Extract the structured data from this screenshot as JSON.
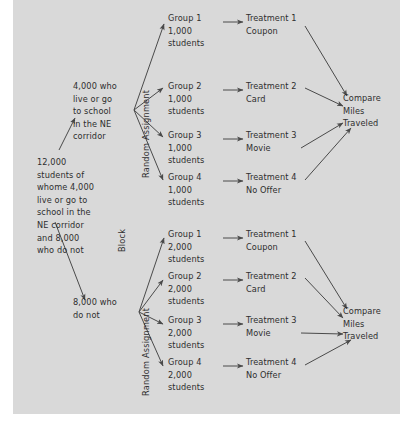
{
  "diagram": {
    "panel_color": "#d9d9d9",
    "ink_color": "#2e2e2e",
    "root": {
      "label": "12,000\nstudents of\nwhome 4,000\nlive or go to\nschool in the\nNE corridor\nand 8,000\nwho do not"
    },
    "blocks": [
      {
        "label": "4,000 who\nlive or go\nto school\nin the NE\ncorridor"
      },
      {
        "label": "8,000 who\ndo not"
      }
    ],
    "stage_labels": {
      "block": "Block",
      "random_assignment_top": "Random Assignment",
      "random_assignment_bottom": "Random Assignment"
    },
    "top_branch": {
      "groups": [
        {
          "label": "Group 1\n1,000\nstudents"
        },
        {
          "label": "Group 2\n1,000\nstudents"
        },
        {
          "label": "Group 3\n1,000\nstudents"
        },
        {
          "label": "Group 4\n1,000\nstudents"
        }
      ],
      "treatments": [
        {
          "label": "Treatment 1\nCoupon"
        },
        {
          "label": "Treatment 2\nCard"
        },
        {
          "label": "Treatment 3\nMovie"
        },
        {
          "label": "Treatment 4\nNo Offer"
        }
      ],
      "outcome": {
        "label": "Compare\nMiles\nTraveled"
      }
    },
    "bottom_branch": {
      "groups": [
        {
          "label": "Group 1\n2,000\nstudents"
        },
        {
          "label": "Group 2\n2,000\nstudents"
        },
        {
          "label": "Group 3\n2,000\nstudents"
        },
        {
          "label": "Group 4\n2,000\nstudents"
        }
      ],
      "treatments": [
        {
          "label": "Treatment 1\nCoupon"
        },
        {
          "label": "Treatment 2\nCard"
        },
        {
          "label": "Treatment 3\nMovie"
        },
        {
          "label": "Treatment 4\nNo Offer"
        }
      ],
      "outcome": {
        "label": "Compare\nMiles\nTraveled"
      }
    }
  }
}
